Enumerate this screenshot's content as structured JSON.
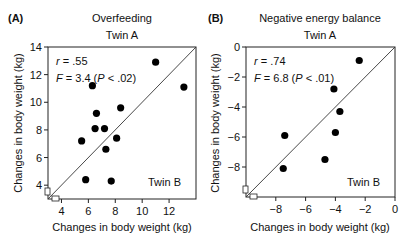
{
  "figure": {
    "panels": [
      {
        "label": "(A)",
        "title": "Overfeeding",
        "top_label": "Twin A",
        "corner_label": "Twin B",
        "stat_r": "r = .55",
        "stat_f": "F = 3.4 (P < .02)"
      },
      {
        "label": "(B)",
        "title": "Negative energy balance",
        "top_label": "Twin A",
        "corner_label": "Twin B",
        "stat_r": "r = .74",
        "stat_f": "F = 6.8 (P < .01)"
      }
    ],
    "ylabel": "Changes in body weight (kg)",
    "xlabel": "Changes in body weight (kg)"
  },
  "chart_data": [
    {
      "type": "scatter",
      "title": "Overfeeding",
      "panel": "(A)",
      "xlabel": "Changes in body weight (kg)",
      "ylabel": "Changes in body weight (kg)",
      "x_series_label": "Twin B",
      "y_series_label": "Twin A",
      "xlim": [
        3,
        14
      ],
      "ylim": [
        3,
        14
      ],
      "xticks": [
        4,
        6,
        8,
        10,
        12
      ],
      "yticks": [
        4,
        6,
        8,
        10,
        12,
        14
      ],
      "identity_line": true,
      "annotations": [
        "r = .55",
        "F = 3.4 (P < .02)"
      ],
      "points": [
        {
          "x": 6.3,
          "y": 11.2
        },
        {
          "x": 11.0,
          "y": 12.9
        },
        {
          "x": 13.1,
          "y": 11.1
        },
        {
          "x": 6.6,
          "y": 9.2
        },
        {
          "x": 8.4,
          "y": 9.6
        },
        {
          "x": 6.5,
          "y": 8.1
        },
        {
          "x": 7.2,
          "y": 8.1
        },
        {
          "x": 5.5,
          "y": 7.2
        },
        {
          "x": 8.1,
          "y": 7.4
        },
        {
          "x": 7.3,
          "y": 6.6
        },
        {
          "x": 5.8,
          "y": 4.4
        },
        {
          "x": 7.7,
          "y": 4.3
        }
      ]
    },
    {
      "type": "scatter",
      "title": "Negative energy balance",
      "panel": "(B)",
      "xlabel": "Changes in body weight (kg)",
      "ylabel": "Changes in body weight (kg)",
      "x_series_label": "Twin B",
      "y_series_label": "Twin A",
      "xlim": [
        -10,
        0
      ],
      "ylim": [
        -10,
        0
      ],
      "xticks": [
        -8,
        -6,
        -4,
        -2,
        0
      ],
      "yticks": [
        0,
        -2,
        -4,
        -6,
        -8
      ],
      "identity_line": true,
      "annotations": [
        "r = .74",
        "F = 6.8 (P < .01)"
      ],
      "points": [
        {
          "x": -2.4,
          "y": -0.9
        },
        {
          "x": -4.1,
          "y": -2.8
        },
        {
          "x": -3.7,
          "y": -4.3
        },
        {
          "x": -7.4,
          "y": -5.9
        },
        {
          "x": -4.0,
          "y": -5.7
        },
        {
          "x": -4.7,
          "y": -7.5
        },
        {
          "x": -7.5,
          "y": -8.1
        }
      ]
    }
  ]
}
